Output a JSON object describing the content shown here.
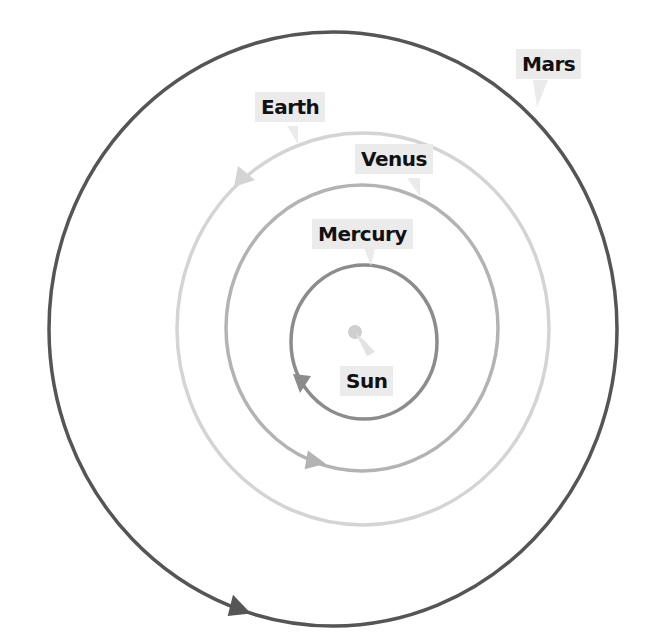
{
  "diagram": {
    "labels": {
      "sun": "Sun",
      "mercury": "Mercury",
      "venus": "Venus",
      "earth": "Earth",
      "mars": "Mars"
    },
    "colors": {
      "background": "#ffffff",
      "label_bg": "#ebebeb",
      "label_text": "#111111",
      "sun": "#cfcfcf",
      "mercury_orbit": "#8c8c8c",
      "venus_orbit": "#b3b3b3",
      "earth_orbit": "#d4d4d4",
      "mars_orbit": "#555555"
    },
    "bodies": [
      {
        "name": "Sun",
        "cx": 355,
        "cy": 332,
        "r": 7
      },
      {
        "name": "Mercury",
        "cx": 364,
        "cy": 342,
        "rx": 73,
        "ry": 77
      },
      {
        "name": "Venus",
        "cx": 362,
        "cy": 328,
        "rx": 136,
        "ry": 143
      },
      {
        "name": "Earth",
        "cx": 363,
        "cy": 329,
        "rx": 186,
        "ry": 196
      },
      {
        "name": "Mars",
        "cx": 333,
        "cy": 329,
        "rx": 284,
        "ry": 297
      }
    ]
  }
}
